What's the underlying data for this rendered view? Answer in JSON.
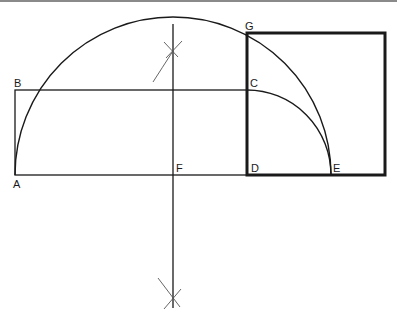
{
  "diagram": {
    "colors": {
      "stroke": "#1a1a1a",
      "construction": "#555555",
      "border": "#8a8a8a",
      "background": "#ffffff"
    },
    "points": {
      "A": {
        "label": "A",
        "x": 15,
        "y": 175
      },
      "B": {
        "label": "B",
        "x": 15,
        "y": 90
      },
      "C": {
        "label": "C",
        "x": 247,
        "y": 90
      },
      "D": {
        "label": "D",
        "x": 247,
        "y": 175
      },
      "E": {
        "label": "E",
        "x": 331,
        "y": 175
      },
      "F": {
        "label": "F",
        "x": 173,
        "y": 175
      },
      "G": {
        "label": "G",
        "x": 247,
        "y": 33
      }
    },
    "labels": {
      "A": "A",
      "B": "B",
      "C": "C",
      "D": "D",
      "E": "E",
      "F": "F",
      "G": "G"
    }
  }
}
